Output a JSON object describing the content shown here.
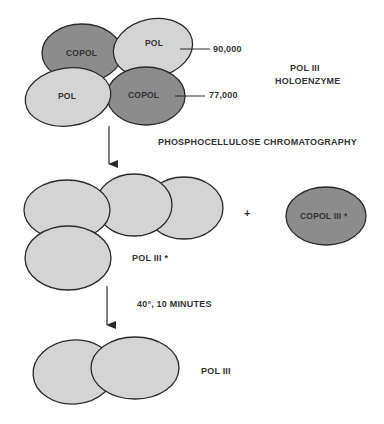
{
  "diagram": {
    "colors": {
      "pol_fill": "#d4d4d4",
      "copol_fill": "#8c8c8c",
      "stroke": "#2a2a2a",
      "text": "#333333"
    },
    "stage1": {
      "subunits": [
        {
          "label": "COPOL",
          "type": "copol"
        },
        {
          "label": "POL",
          "type": "pol"
        },
        {
          "label": "POL",
          "type": "pol"
        },
        {
          "label": "COPOL",
          "type": "copol"
        }
      ],
      "mw_upper": "90,000",
      "mw_lower": "77,000",
      "name_line1": "POL III",
      "name_line2": "HOLOENZYME"
    },
    "step1": {
      "label": "PHOSPHOCELLULOSE CHROMATOGRAPHY"
    },
    "stage2": {
      "plus": "+",
      "pol_star_label": "POL III *",
      "copol_star_label": "COPOL III *"
    },
    "step2": {
      "label": "40°, 10 MINUTES"
    },
    "stage3": {
      "label": "POL III"
    }
  }
}
